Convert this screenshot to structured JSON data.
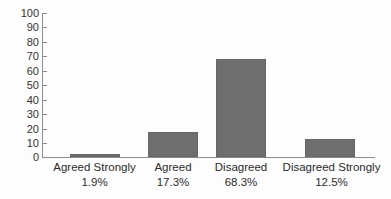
{
  "chart_data": {
    "type": "bar",
    "title": "",
    "subtitle": "",
    "xlabel": "",
    "ylabel": "",
    "ylim": [
      0,
      100
    ],
    "yticks": [
      "0",
      "10",
      "20",
      "30",
      "40",
      "50",
      "60",
      "70",
      "80",
      "90",
      "100"
    ],
    "grid": false,
    "legend": false,
    "legend_position": "none",
    "bar_color": "#6e6e6e",
    "bar_edge_color": "#666666",
    "axis_color": "#8c8c8c",
    "background_color": "#fdfdfd",
    "categories": [
      "Agreed Strongly",
      "Agreed",
      "Disagreed",
      "Disagreed Strongly"
    ],
    "values": [
      1.9,
      17.3,
      68.3,
      12.5
    ],
    "value_labels": [
      "1.9%",
      "17.3%",
      "68.3%",
      "12.5%"
    ],
    "bars": [
      {
        "category": "Agreed Strongly",
        "value": 1.9,
        "label": "1.9%"
      },
      {
        "category": "Agreed",
        "value": 17.3,
        "label": "17.3%"
      },
      {
        "category": "Disagreed",
        "value": 68.3,
        "label": "68.3%"
      },
      {
        "category": "Disagreed Strongly",
        "value": 12.5,
        "label": "12.5%"
      }
    ]
  }
}
